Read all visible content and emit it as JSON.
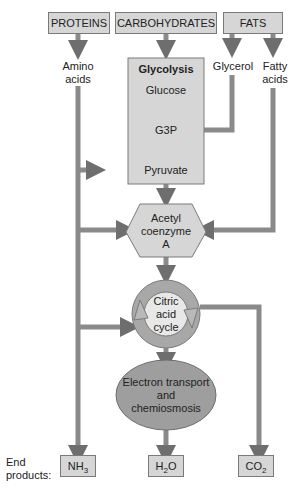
{
  "sources": {
    "proteins": "PROTEINS",
    "carbohydrates": "CARBOHYDRATES",
    "fats": "FATS"
  },
  "intermediates": {
    "amino_acids_1": "Amino",
    "amino_acids_2": "acids",
    "glycerol": "Glycerol",
    "fatty_acids_1": "Fatty",
    "fatty_acids_2": "acids"
  },
  "glycolysis": {
    "title": "Glycolysis",
    "glucose": "Glucose",
    "g3p": "G3P",
    "pyruvate": "Pyruvate"
  },
  "acetyl_coa": {
    "line1": "Acetyl",
    "line2": "coenzyme",
    "line3": "A"
  },
  "citric_acid_cycle": {
    "line1": "Citric",
    "line2": "acid",
    "line3": "cycle"
  },
  "electron_transport": {
    "line1": "Electron transport",
    "line2": "and",
    "line3": "chemiosmosis"
  },
  "end_products": {
    "label_1": "End",
    "label_2": "products:",
    "nh3": "NH",
    "nh3_sub": "3",
    "h2o_a": "H",
    "h2o_sub": "2",
    "h2o_b": "O",
    "co2": "CO",
    "co2_sub": "2"
  },
  "colors": {
    "box_fill": "#d6d6d6",
    "arrow": "#7f7f7f",
    "ellipse": "#9e9e9e",
    "ring": "#a8a8a8"
  }
}
